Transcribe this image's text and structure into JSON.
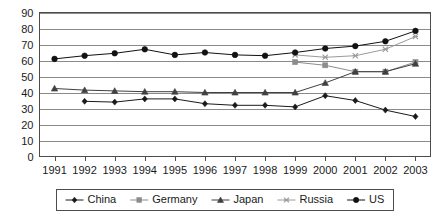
{
  "chart_data": {
    "type": "line",
    "title": "",
    "subtitle": "",
    "xlabel": "",
    "ylabel": "",
    "x": [
      1991,
      1992,
      1993,
      1994,
      1995,
      1996,
      1997,
      1998,
      1999,
      2000,
      2001,
      2002,
      2003
    ],
    "xtick_labels": [
      "1991",
      "1992",
      "1993",
      "1994",
      "1995",
      "1996",
      "1997",
      "1998",
      "1999",
      "2000",
      "2001",
      "2002",
      "2003"
    ],
    "ytick_labels": [
      "0",
      "10",
      "20",
      "30",
      "40",
      "50",
      "60",
      "70",
      "80",
      "90"
    ],
    "ytick_values": [
      0,
      10,
      20,
      30,
      40,
      50,
      60,
      70,
      80,
      90
    ],
    "ylim": [
      0,
      90
    ],
    "grid": true,
    "grid_axis": "y",
    "legend_position": "bottom",
    "series": [
      {
        "name": "China",
        "marker": "diamond",
        "color": "#1a1a1a",
        "values": [
          null,
          34.5,
          34,
          36,
          36,
          33,
          32,
          32,
          31,
          38,
          35,
          29,
          25
        ]
      },
      {
        "name": "Germany",
        "marker": "square",
        "color": "#8c8c8c",
        "values": [
          null,
          null,
          null,
          null,
          null,
          null,
          null,
          null,
          59,
          57,
          53,
          53,
          59
        ]
      },
      {
        "name": "Japan",
        "marker": "triangle",
        "color": "#404040",
        "values": [
          42.5,
          41.5,
          41,
          40.5,
          40.5,
          40,
          40,
          40,
          40,
          46,
          53,
          53,
          58
        ]
      },
      {
        "name": "Russia",
        "marker": "cross",
        "color": "#9a9a9a",
        "values": [
          null,
          null,
          null,
          null,
          null,
          null,
          null,
          null,
          63.5,
          62,
          63,
          67,
          75
        ]
      },
      {
        "name": "US",
        "marker": "circle",
        "color": "#111111",
        "values": [
          61,
          63,
          64.5,
          67,
          63.5,
          65,
          63.5,
          63,
          65,
          67.5,
          69,
          72,
          78.5
        ]
      }
    ]
  },
  "legend": {
    "items": [
      {
        "label": "China",
        "marker": "diamond",
        "color": "#1a1a1a"
      },
      {
        "label": "Germany",
        "marker": "square",
        "color": "#8c8c8c"
      },
      {
        "label": "Japan",
        "marker": "triangle",
        "color": "#404040"
      },
      {
        "label": "Russia",
        "marker": "cross",
        "color": "#9a9a9a"
      },
      {
        "label": "US",
        "marker": "circle",
        "color": "#111111"
      }
    ]
  }
}
